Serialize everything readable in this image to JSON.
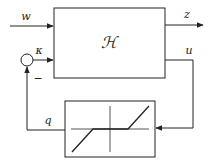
{
  "diagram": {
    "type": "feedback-block-diagram",
    "blocks": {
      "plant": {
        "label": "ℋ"
      },
      "nonlinearity": {
        "label": "",
        "kind": "dead-zone"
      }
    },
    "signals": {
      "w": "w",
      "z": "z",
      "u": "u",
      "q": "q",
      "kappa": "κ"
    },
    "summing_junction": {
      "sign": "−"
    },
    "colors": {
      "stroke": "#222222",
      "background": "#ffffff"
    }
  }
}
